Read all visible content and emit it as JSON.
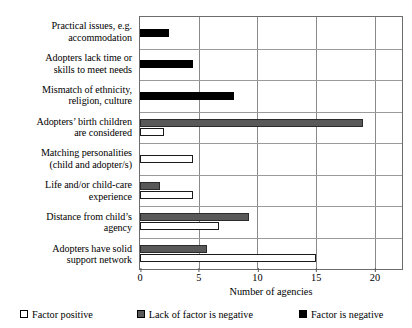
{
  "chart_data": {
    "type": "bar",
    "orientation": "horizontal",
    "title": "",
    "xlabel": "Number of agencies",
    "ylabel": "",
    "xlim": [
      0,
      22.3
    ],
    "xticks": [
      0,
      5,
      10,
      15,
      20
    ],
    "grid": true,
    "legend_position": "bottom",
    "categories": [
      "Practical issues, e.g. accommodation",
      "Adopters lack time or skills to meet needs",
      "Mismatch of ethnicity, religion, culture",
      "Adopters' birth children are considered",
      "Matching personalities (child and adopter/s)",
      "Life and/or child-care experience",
      "Distance from child's agency",
      "Adopters have solid support network"
    ],
    "category_lines": [
      [
        "Practical issues, e.g.",
        "accommodation"
      ],
      [
        "Adopters lack time or",
        "skills to meet needs"
      ],
      [
        "Mismatch of ethnicity,",
        "religion, culture"
      ],
      [
        "Adopters’ birth children",
        "are considered"
      ],
      [
        "Matching personalities",
        "(child and adopter/s)"
      ],
      [
        "Life and/or child-care",
        "experience"
      ],
      [
        "Distance from child’s",
        "agency"
      ],
      [
        "Adopters have solid",
        "support network"
      ]
    ],
    "series": [
      {
        "name": "Factor positive",
        "key": "positive",
        "color": "#ffffff",
        "values": [
          0,
          0,
          0,
          2,
          4.5,
          4.5,
          6.7,
          15
        ]
      },
      {
        "name": "Lack of factor is negative",
        "key": "lack",
        "color": "#595959",
        "values": [
          0,
          0,
          0,
          19,
          0,
          1.7,
          9.3,
          5.7
        ]
      },
      {
        "name": "Factor is negative",
        "key": "negative",
        "color": "#000000",
        "values": [
          2.5,
          4.5,
          8,
          0,
          0,
          0,
          0,
          0
        ]
      }
    ]
  },
  "axis": {
    "tick_labels": [
      "0",
      "5",
      "10",
      "15",
      "20"
    ],
    "x_axis_title": "Number of agencies"
  },
  "legend": {
    "items": [
      {
        "label": "Factor positive",
        "key": "positive"
      },
      {
        "label": "Lack of factor is negative",
        "key": "lack"
      },
      {
        "label": "Factor is negative",
        "key": "negative"
      }
    ]
  }
}
